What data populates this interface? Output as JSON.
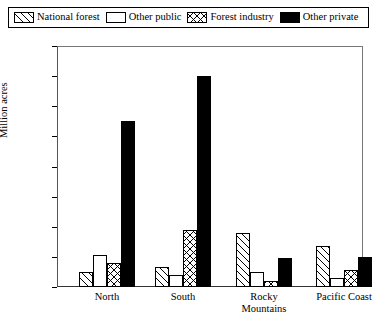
{
  "legend": {
    "items": [
      {
        "label": "National forest",
        "pattern": "diagonal-hatch",
        "color": "#000000"
      },
      {
        "label": "Other public",
        "pattern": "empty",
        "color": "#ffffff"
      },
      {
        "label": "Forest industry",
        "pattern": "cross-hatch",
        "color": "#000000"
      },
      {
        "label": "Other private",
        "pattern": "solid",
        "color": "#000000"
      }
    ]
  },
  "axes": {
    "ylabel": "Million acres",
    "yticks": [
      "0",
      "20",
      "40",
      "60",
      "80",
      "100",
      "120",
      "140",
      "160"
    ]
  },
  "chart_data": {
    "type": "bar",
    "title": "",
    "xlabel": "",
    "ylabel": "Million acres",
    "ylim": [
      0,
      160
    ],
    "ytick_step": 20,
    "grid": false,
    "legend_position": "top",
    "categories": [
      "North",
      "South",
      "Rocky Mountains",
      "Pacific Coast"
    ],
    "category_lines": [
      [
        "North"
      ],
      [
        "South"
      ],
      [
        "Rocky",
        "Mountains"
      ],
      [
        "Pacific Coast"
      ]
    ],
    "series": [
      {
        "name": "National forest",
        "pattern": "diagonal-hatch",
        "values": [
          10,
          13,
          36,
          27
        ]
      },
      {
        "name": "Other public",
        "pattern": "empty",
        "values": [
          21,
          8,
          10,
          6
        ]
      },
      {
        "name": "Forest industry",
        "pattern": "cross-hatch",
        "values": [
          16,
          38,
          4,
          11
        ]
      },
      {
        "name": "Other private",
        "pattern": "solid",
        "values": [
          110,
          140,
          19,
          20
        ]
      }
    ]
  }
}
